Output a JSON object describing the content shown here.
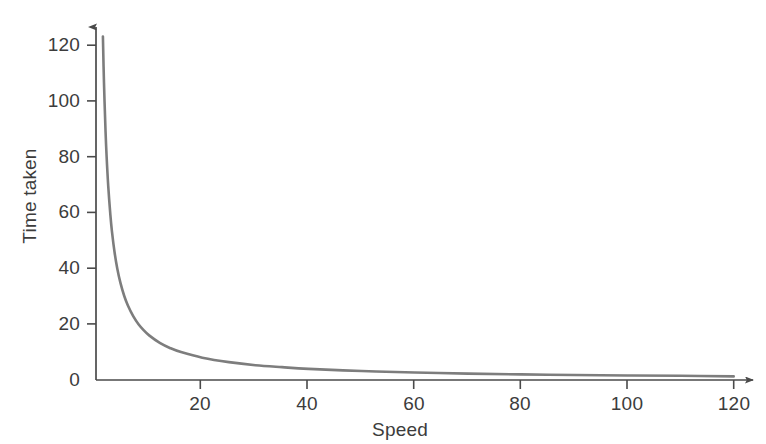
{
  "chart_data": {
    "type": "line",
    "title": "",
    "subtitle": "",
    "xlabel": "Speed",
    "ylabel": "Time taken",
    "xlim": [
      0,
      126
    ],
    "ylim": [
      0,
      130
    ],
    "xticks": [
      20,
      40,
      60,
      80,
      100,
      120
    ],
    "xtick_labels": [
      "20",
      "40",
      "60",
      "80",
      "100",
      "120"
    ],
    "yticks": [
      0,
      20,
      40,
      60,
      80,
      100,
      120
    ],
    "ytick_labels": [
      "0",
      "20",
      "40",
      "60",
      "80",
      "100",
      "120"
    ],
    "grid": false,
    "legend": null,
    "axis_arrows": {
      "x": true,
      "y": true
    },
    "relationship": "inverse proportion: time = k / speed, k = 160",
    "series": [
      {
        "name": "Time taken vs Speed",
        "color": "#7d7d7d",
        "line_width": 2.6,
        "x": [
          1.3,
          1.5,
          1.8,
          2.0,
          2.3,
          2.7,
          3.0,
          3.5,
          4.0,
          4.6,
          5.3,
          6.0,
          7.0,
          8.0,
          9.0,
          10.0,
          12.0,
          14.0,
          16.0,
          20.0,
          25.0,
          30.0,
          35.0,
          40.0,
          50.0,
          60.0,
          70.0,
          80.0,
          90.0,
          100.0,
          110.0,
          120.0
        ],
        "y": [
          123.1,
          106.7,
          88.9,
          80.0,
          69.6,
          59.3,
          53.3,
          45.7,
          40.0,
          34.8,
          30.2,
          26.7,
          22.9,
          20.0,
          17.8,
          16.0,
          13.3,
          11.4,
          10.0,
          8.0,
          6.4,
          5.3,
          4.6,
          4.0,
          3.2,
          2.7,
          2.3,
          2.0,
          1.8,
          1.6,
          1.5,
          1.3
        ]
      }
    ]
  },
  "axes": {
    "x_title": "Speed",
    "y_title": "Time taken",
    "x_tick_labels": [
      "20",
      "40",
      "60",
      "80",
      "100",
      "120"
    ],
    "y_tick_labels": [
      "120",
      "100",
      "80",
      "60",
      "40",
      "20",
      "0"
    ]
  },
  "colors": {
    "curve": "#7d7d7d",
    "axis": "#4a4a4a",
    "text": "#3c3c3c",
    "background": "#ffffff"
  }
}
